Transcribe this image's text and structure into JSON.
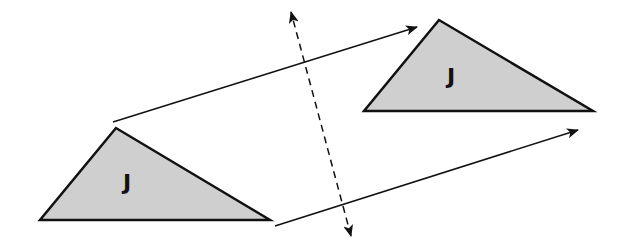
{
  "diagram": {
    "colors": {
      "background": "#ffffff",
      "triangle_fill": "#cfcfcf",
      "stroke": "#111111"
    },
    "original_triangle": {
      "label": "J",
      "points": [
        [
          116,
          128
        ],
        [
          40,
          220
        ],
        [
          270,
          220
        ]
      ],
      "label_pos": [
        127,
        190
      ]
    },
    "image_triangle": {
      "label": "J",
      "points": [
        [
          439,
          20
        ],
        [
          364,
          111
        ],
        [
          593,
          111
        ]
      ],
      "label_pos": [
        451,
        84
      ]
    },
    "translation_arrows": [
      {
        "from": [
          113,
          122
        ],
        "to": [
          417,
          27
        ]
      },
      {
        "from": [
          275,
          226
        ],
        "to": [
          578,
          130
        ]
      }
    ],
    "reflection_line": {
      "style": "dashed",
      "from": [
        351,
        236
      ],
      "to": [
        291,
        12
      ],
      "arrowheads": "both"
    }
  }
}
